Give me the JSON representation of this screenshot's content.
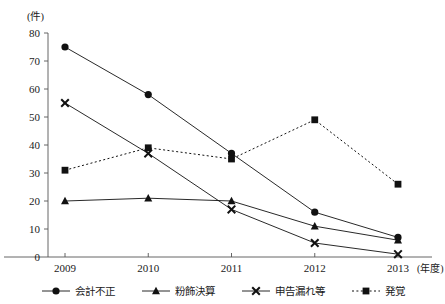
{
  "chart_data": {
    "type": "line",
    "title": "",
    "xlabel": "(年度)",
    "ylabel": "(件)",
    "categories": [
      "2009",
      "2010",
      "2011",
      "2012",
      "2013"
    ],
    "ylim": [
      0,
      80
    ],
    "ytick_step": 10,
    "yticks": [
      "0",
      "10",
      "20",
      "30",
      "40",
      "50",
      "60",
      "70",
      "80"
    ],
    "grid": false,
    "legend_position": "bottom",
    "series": [
      {
        "name": "会計不正",
        "marker": "circle",
        "linestyle": "solid",
        "color": "#111111",
        "values": [
          75,
          58,
          37,
          16,
          7
        ]
      },
      {
        "name": "粉飾決算",
        "marker": "triangle",
        "linestyle": "solid",
        "color": "#111111",
        "values": [
          20,
          21,
          20,
          11,
          6
        ]
      },
      {
        "name": "申告漏れ等",
        "marker": "x",
        "linestyle": "solid",
        "color": "#111111",
        "values": [
          55,
          37,
          17,
          5,
          1
        ]
      },
      {
        "name": "発覚",
        "marker": "square",
        "linestyle": "dotted",
        "color": "#111111",
        "values": [
          31,
          39,
          35,
          49,
          26
        ]
      }
    ]
  },
  "axis": {
    "y_unit": "(件)",
    "x_unit": "(年度)"
  },
  "legend": {
    "items": [
      {
        "label": "会計不正",
        "marker": "circle-marker-icon",
        "linestyle": "solid"
      },
      {
        "label": "粉飾決算",
        "marker": "triangle-marker-icon",
        "linestyle": "solid"
      },
      {
        "label": "申告漏れ等",
        "marker": "x-marker-icon",
        "linestyle": "solid"
      },
      {
        "label": "発覚",
        "marker": "square-marker-icon",
        "linestyle": "dotted"
      }
    ]
  }
}
